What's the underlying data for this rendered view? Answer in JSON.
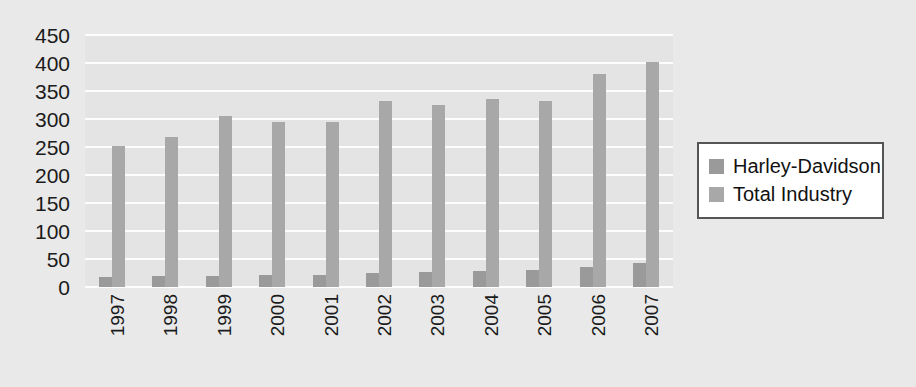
{
  "chart_data": {
    "type": "bar",
    "title": "",
    "subtitle": "",
    "xlabel": "",
    "ylabel": "",
    "categories": [
      "1997",
      "1998",
      "1999",
      "2000",
      "2001",
      "2002",
      "2003",
      "2004",
      "2005",
      "2006",
      "2007"
    ],
    "series": [
      {
        "name": "Harley-Davidson",
        "color": "#9a9a9a",
        "values": [
          18,
          19,
          19,
          22,
          22,
          25,
          26,
          28,
          30,
          35,
          42
        ]
      },
      {
        "name": "Total Industry",
        "color": "#a8a8a8",
        "values": [
          252,
          268,
          305,
          295,
          295,
          333,
          325,
          336,
          333,
          380,
          402
        ]
      }
    ],
    "ylim": [
      0,
      450
    ],
    "ytick_values": [
      0,
      50,
      100,
      150,
      200,
      250,
      300,
      350,
      400,
      450
    ],
    "ytick_labels": [
      "0",
      "50",
      "100",
      "150",
      "200",
      "250",
      "300",
      "350",
      "400",
      "450"
    ],
    "grid": true,
    "grid_color": "#fdfdfd",
    "legend_position": "right",
    "plot_background": "#e4e4e4",
    "figure_background": "#e9e9e9",
    "xtick_rotation": 90
  },
  "legend": {
    "items": [
      {
        "label": "Harley-Davidson",
        "color": "#9a9a9a"
      },
      {
        "label": "Total Industry",
        "color": "#a8a8a8"
      }
    ]
  }
}
